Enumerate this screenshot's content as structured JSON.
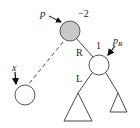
{
  "diagram": {
    "type": "avl-tree-rotation",
    "nodes": {
      "p": {
        "label": "p",
        "balance": "−2",
        "fill": "#c8c8c8"
      },
      "pR": {
        "label": "p",
        "subscript": "R",
        "balance": "1",
        "fill": "#ffffff"
      },
      "x": {
        "label": "x",
        "fill": "#ffffff"
      }
    },
    "edges": {
      "p_to_pR": {
        "label": "R",
        "style": "solid"
      },
      "pR_to_left": {
        "label": "L",
        "style": "solid"
      },
      "p_to_x": {
        "style": "dashed"
      }
    },
    "colors": {
      "stroke": "#333333",
      "highlight_node": "#c8c8c8"
    }
  }
}
